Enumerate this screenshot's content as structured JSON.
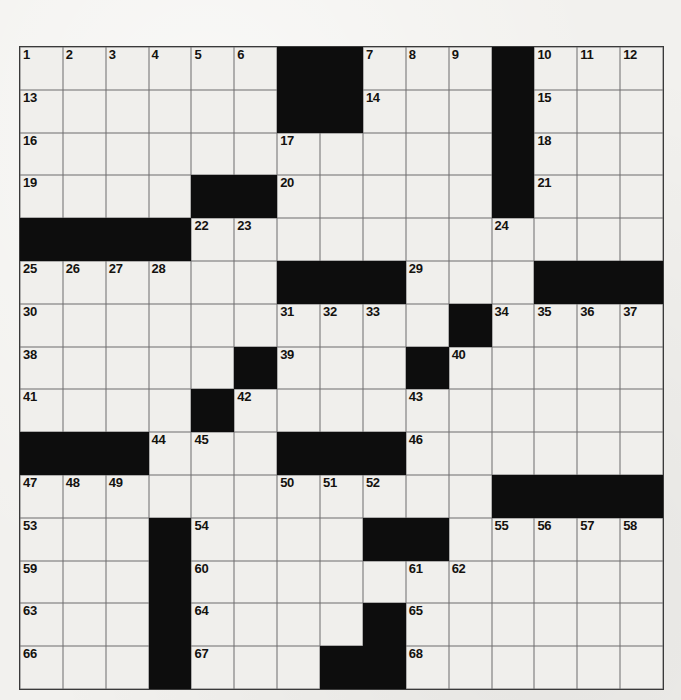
{
  "puzzle": {
    "title": "Crossword Puzzle Grid",
    "rows": 15,
    "columns": 15,
    "cell_color": "#f0efec",
    "block_color": "#0d0d0d",
    "grid_line_color": "#6d6d6d",
    "page_background": "#f2f1ee",
    "number_count": 68,
    "grid": [
      [
        "1",
        "2",
        "3",
        "4",
        "5",
        "6",
        "#",
        "#",
        "7",
        "8",
        "9",
        "#",
        "10",
        "11",
        "12"
      ],
      [
        "13",
        "",
        "",
        "",
        "",
        "",
        "#",
        "#",
        "14",
        "",
        "",
        "#",
        "15",
        "",
        ""
      ],
      [
        "16",
        "",
        "",
        "",
        "",
        "",
        "17",
        "",
        "",
        "",
        "",
        "#",
        "18",
        "",
        ""
      ],
      [
        "19",
        "",
        "",
        "",
        "#",
        "#",
        "20",
        "",
        "",
        "",
        "",
        "#",
        "21",
        "",
        ""
      ],
      [
        "#",
        "#",
        "#",
        "#",
        "22",
        "23",
        "",
        "",
        "",
        "",
        "",
        "24",
        "",
        "",
        ""
      ],
      [
        "25",
        "26",
        "27",
        "28",
        "",
        "",
        "#",
        "#",
        "#",
        "29",
        "",
        "",
        "#",
        "#",
        "#"
      ],
      [
        "30",
        "",
        "",
        "",
        "",
        "",
        "31",
        "32",
        "33",
        "",
        "#",
        "34",
        "35",
        "36",
        "37"
      ],
      [
        "38",
        "",
        "",
        "",
        "",
        "#",
        "39",
        "",
        "",
        "#",
        "40",
        "",
        "",
        "",
        ""
      ],
      [
        "41",
        "",
        "",
        "",
        "#",
        "42",
        "",
        "",
        "",
        "43",
        "",
        "",
        "",
        "",
        ""
      ],
      [
        "#",
        "#",
        "#",
        "44",
        "45",
        "",
        "#",
        "#",
        "#",
        "46",
        "",
        "",
        "",
        "",
        ""
      ],
      [
        "47",
        "48",
        "49",
        "",
        "",
        "",
        "50",
        "51",
        "52",
        "",
        "",
        "#",
        "#",
        "#",
        "#"
      ],
      [
        "53",
        "",
        "",
        "#",
        "54",
        "",
        "",
        "",
        "#",
        "#",
        "",
        "55",
        "56",
        "57",
        "58"
      ],
      [
        "59",
        "",
        "",
        "#",
        "60",
        "",
        "",
        "",
        "",
        "61",
        "62",
        "",
        "",
        "",
        ""
      ],
      [
        "63",
        "",
        "",
        "#",
        "64",
        "",
        "",
        "",
        "#",
        "65",
        "",
        "",
        "",
        "",
        ""
      ],
      [
        "66",
        "",
        "",
        "#",
        "67",
        "",
        "",
        "#",
        "#",
        "68",
        "",
        "",
        "",
        "",
        ""
      ]
    ]
  }
}
